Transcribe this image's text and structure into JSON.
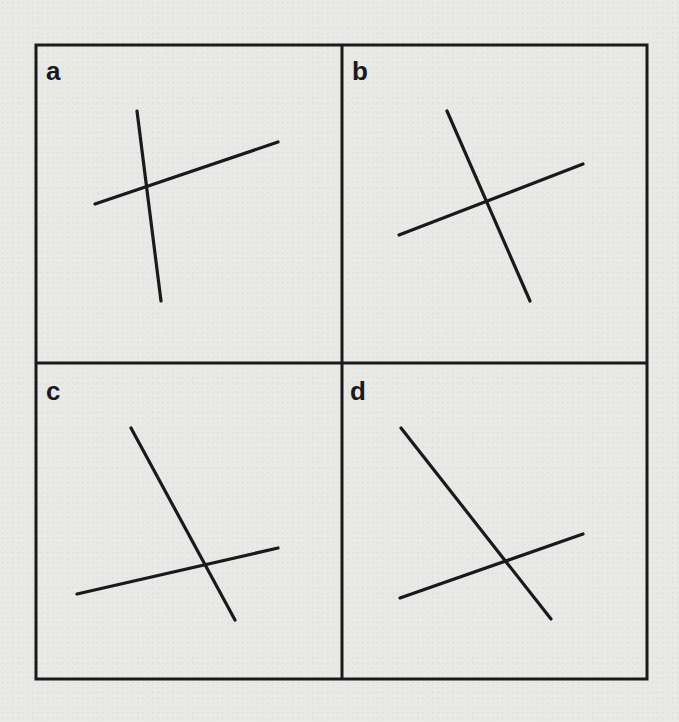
{
  "figure": {
    "background": "#e9e9e7",
    "ink": "#1a1a1a",
    "frame": {
      "x1": 36,
      "y1": 45,
      "x2": 647,
      "y2": 679,
      "divider_x": 342,
      "divider_y": 363
    },
    "panels": [
      {
        "label": "a",
        "label_pos": [
          46,
          80
        ],
        "lines": [
          {
            "x1": 137,
            "y1": 111,
            "x2": 161,
            "y2": 301
          },
          {
            "x1": 95,
            "y1": 204,
            "x2": 278,
            "y2": 142
          }
        ]
      },
      {
        "label": "b",
        "label_pos": [
          352,
          80
        ],
        "lines": [
          {
            "x1": 447,
            "y1": 111,
            "x2": 530,
            "y2": 301
          },
          {
            "x1": 399,
            "y1": 235,
            "x2": 583,
            "y2": 164
          }
        ]
      },
      {
        "label": "c",
        "label_pos": [
          46,
          400
        ],
        "lines": [
          {
            "x1": 131,
            "y1": 428,
            "x2": 235,
            "y2": 620
          },
          {
            "x1": 77,
            "y1": 594,
            "x2": 278,
            "y2": 548
          }
        ]
      },
      {
        "label": "d",
        "label_pos": [
          350,
          400
        ],
        "lines": [
          {
            "x1": 401,
            "y1": 428,
            "x2": 551,
            "y2": 619
          },
          {
            "x1": 400,
            "y1": 598,
            "x2": 583,
            "y2": 534
          }
        ]
      }
    ]
  }
}
